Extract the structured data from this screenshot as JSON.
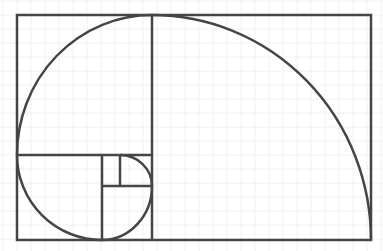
{
  "diagram": {
    "type": "golden-spiral",
    "width": 383,
    "height": 251,
    "colors": {
      "background": "#ffffff",
      "grid": "#f0f0f0",
      "stroke": "#454545"
    },
    "grid_spacing": 14,
    "frame": {
      "x": 17,
      "y": 15,
      "width": 354,
      "height": 225
    },
    "dividers": [
      {
        "x1": 152,
        "y1": 15,
        "x2": 152,
        "y2": 240
      },
      {
        "x1": 17,
        "y1": 155,
        "x2": 152,
        "y2": 155
      },
      {
        "x1": 102,
        "y1": 155,
        "x2": 102,
        "y2": 240
      },
      {
        "x1": 102,
        "y1": 186,
        "x2": 152,
        "y2": 186
      },
      {
        "x1": 120,
        "y1": 155,
        "x2": 120,
        "y2": 186
      }
    ],
    "spiral_arcs": [
      {
        "from": [
          371,
          240
        ],
        "to": [
          152,
          15
        ],
        "radius": 220,
        "center": [
          152,
          240
        ]
      },
      {
        "from": [
          152,
          15
        ],
        "to": [
          17,
          155
        ],
        "radius": 137,
        "center": [
          152,
          155
        ]
      },
      {
        "from": [
          17,
          155
        ],
        "to": [
          102,
          240
        ],
        "radius": 85,
        "center": [
          102,
          155
        ]
      },
      {
        "from": [
          102,
          240
        ],
        "to": [
          152,
          186
        ],
        "radius": 52,
        "center": [
          102,
          186
        ]
      },
      {
        "from": [
          152,
          186
        ],
        "to": [
          120,
          155
        ],
        "radius": 32,
        "center": [
          120,
          186
        ]
      }
    ]
  }
}
